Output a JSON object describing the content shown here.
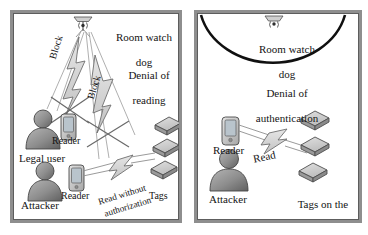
{
  "figure": {
    "type": "diagram",
    "panel_count": 2
  },
  "panels": [
    {
      "id": "left",
      "scenario": "Denial of reading",
      "watchdog": {
        "label_line1": "Room watch",
        "label_line2": "dog",
        "icon": "antenna-icon",
        "mounted": "ceiling"
      },
      "scenario_label_line1": "Denial of",
      "scenario_label_line2": "reading",
      "actors": [
        {
          "name": "legal-user",
          "label": "Legal user",
          "device_label": "Reader"
        },
        {
          "name": "attacker",
          "label": "Attacker",
          "device_label": "Reader"
        }
      ],
      "tags": {
        "label": "Tags",
        "count": 3
      },
      "signals": [
        {
          "name": "block-upper",
          "label": "Block",
          "blocked": true
        },
        {
          "name": "block-lower",
          "label": "Block",
          "blocked": true
        },
        {
          "name": "unauthorized-read",
          "label_line1": "Read without",
          "label_line2": "authorization",
          "blocked": false
        }
      ]
    },
    {
      "id": "right",
      "scenario": "Denial of authentication",
      "watchdog": {
        "label_line1": "Room watch",
        "label_line2": "dog",
        "icon": "antenna-icon",
        "mounted": "ceiling"
      },
      "scenario_label_line1": "Denial of",
      "scenario_label_line2": "authentication",
      "actors": [
        {
          "name": "attacker",
          "label": "Attacker",
          "device_label": "Reader"
        }
      ],
      "tags": {
        "label_line1": "Tags on the",
        "label_line2": "instrument",
        "count": 3
      },
      "signals": [
        {
          "name": "read",
          "label": "Read",
          "blocked": false
        }
      ]
    }
  ],
  "colors": {
    "frame_outer": "#8e8e8e",
    "frame_inner": "#5d5d5d",
    "background": "#ffffff",
    "text": "#141414",
    "bolt_fill": "#d4d4d4",
    "bolt_stroke": "#6e6e6e",
    "person_fill": "#8a8a8a",
    "person_stroke": "#4a4a4a",
    "tag_top": "#cfcfcf",
    "tag_side": "#9a9a9a",
    "tag_stroke": "#4f4f4f",
    "arc_stroke": "#111111",
    "cross_stroke": "#6a6a6a"
  }
}
